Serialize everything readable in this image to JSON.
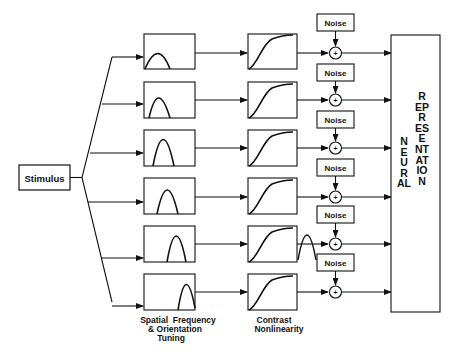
{
  "diagram": {
    "stimulus": {
      "label": "Stimulus"
    },
    "channels": [
      {
        "id": 1,
        "tuning_peak": "low",
        "noise_label": "Noise",
        "sum_symbol": "+"
      },
      {
        "id": 2,
        "tuning_peak": "low-mid",
        "noise_label": "Noise",
        "sum_symbol": "+"
      },
      {
        "id": 3,
        "tuning_peak": "mid",
        "noise_label": "Noise",
        "sum_symbol": "+"
      },
      {
        "id": 4,
        "tuning_peak": "mid-high",
        "noise_label": "Noise",
        "sum_symbol": "+"
      },
      {
        "id": 5,
        "tuning_peak": "high",
        "noise_label": "Noise",
        "sum_symbol": "+"
      },
      {
        "id": 6,
        "tuning_peak": "highest",
        "noise_label": "Noise",
        "sum_symbol": "+"
      }
    ],
    "stage_labels": {
      "tuning_line1": "Spatial  Frequency",
      "tuning_line2": "& Orientation",
      "tuning_line3": "Tuning",
      "contrast_line1": "Contrast",
      "contrast_line2": "Nonlinearity"
    },
    "output": {
      "word1": "NEURAL",
      "word2": "REPRESENTATION"
    }
  }
}
